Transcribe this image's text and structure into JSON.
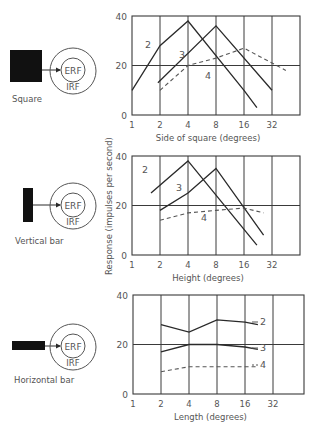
{
  "figure": {
    "ylabel": "Response (impulses per second)",
    "panels": [
      {
        "stimulus": "Square",
        "xlabel": "Side of square (degrees)",
        "erf": "ERF",
        "irf": "IRF"
      },
      {
        "stimulus": "Vertical bar",
        "xlabel": "Height (degrees)",
        "erf": "ERF",
        "irf": "IRF"
      },
      {
        "stimulus": "Horizontal bar",
        "xlabel": "Length (degrees)",
        "erf": "ERF",
        "irf": "IRF"
      }
    ]
  },
  "chart_data": [
    {
      "type": "line",
      "title": "Square",
      "xlabel": "Side of square (degrees)",
      "ylabel": "Response (impulses per second)",
      "xscale": "log2",
      "xticks": [
        "1",
        "2",
        "4",
        "8",
        "16",
        "32"
      ],
      "yticks": [
        "0",
        "20",
        "40"
      ],
      "ylim": [
        0,
        40
      ],
      "grid": true,
      "series": [
        {
          "name": "2",
          "style": "solid",
          "x": [
            1,
            2,
            4,
            16,
            22
          ],
          "y": [
            10,
            28,
            38,
            10,
            3
          ]
        },
        {
          "name": "3",
          "style": "solid",
          "x": [
            1.9,
            8,
            32
          ],
          "y": [
            13,
            36,
            10
          ]
        },
        {
          "name": "4",
          "style": "dashed",
          "x": [
            2,
            4,
            8,
            16,
            32,
            45
          ],
          "y": [
            10,
            20,
            23,
            27,
            21,
            18
          ]
        }
      ]
    },
    {
      "type": "line",
      "title": "Vertical bar",
      "xlabel": "Height (degrees)",
      "ylabel": "Response (impulses per second)",
      "xscale": "log2",
      "xticks": [
        "1",
        "2",
        "4",
        "8",
        "16",
        "32"
      ],
      "yticks": [
        "0",
        "20",
        "40"
      ],
      "ylim": [
        0,
        40
      ],
      "grid": true,
      "series": [
        {
          "name": "2",
          "style": "solid",
          "x": [
            1.6,
            4,
            22
          ],
          "y": [
            25,
            38,
            4
          ]
        },
        {
          "name": "3",
          "style": "solid",
          "x": [
            2,
            4,
            8,
            26
          ],
          "y": [
            18,
            25,
            35,
            8
          ]
        },
        {
          "name": "4",
          "style": "dashed",
          "x": [
            2,
            4,
            8,
            16,
            26
          ],
          "y": [
            14,
            17,
            18,
            19,
            17
          ]
        }
      ]
    },
    {
      "type": "line",
      "title": "Horizontal bar",
      "xlabel": "Length (degrees)",
      "ylabel": "Response (impulses per second)",
      "xscale": "log2",
      "xticks": [
        "1",
        "2",
        "4",
        "8",
        "16",
        "32"
      ],
      "yticks": [
        "0",
        "20",
        "40"
      ],
      "ylim": [
        0,
        40
      ],
      "grid": true,
      "series": [
        {
          "name": "2",
          "style": "solid",
          "x": [
            2,
            4,
            8,
            16,
            22
          ],
          "y": [
            28,
            25,
            30,
            29,
            28
          ]
        },
        {
          "name": "3",
          "style": "solid",
          "x": [
            2,
            4,
            8,
            16,
            22
          ],
          "y": [
            17,
            20,
            20,
            19,
            18
          ]
        },
        {
          "name": "4",
          "style": "dashed",
          "x": [
            2,
            4,
            8,
            16,
            22
          ],
          "y": [
            9,
            11,
            11,
            11,
            11
          ]
        }
      ]
    }
  ]
}
